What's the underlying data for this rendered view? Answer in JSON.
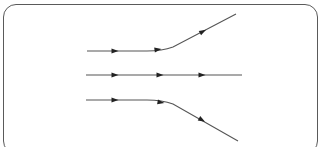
{
  "diagram": {
    "type": "flow-lines",
    "line_color": "#555555",
    "border_color": "#5a5a5a",
    "lines": [
      {
        "name": "top-line",
        "path": "M87,51 L147,51 Q162,51 173,47 L236,14",
        "arrows": [
          [
            115,
            51,
            0
          ],
          [
            158,
            49.5,
            -8
          ],
          [
            203,
            31.5,
            -28
          ]
        ]
      },
      {
        "name": "middle-line",
        "path": "M86,75 L242,75",
        "arrows": [
          [
            115,
            75,
            0
          ],
          [
            160,
            75,
            0
          ],
          [
            202,
            75,
            0
          ]
        ]
      },
      {
        "name": "bottom-line",
        "path": "M86,100 L147,100 Q162,100 173,104 L238,141",
        "arrows": [
          [
            115,
            100,
            0
          ],
          [
            161,
            102.5,
            10
          ],
          [
            202,
            120,
            30
          ]
        ]
      }
    ]
  }
}
